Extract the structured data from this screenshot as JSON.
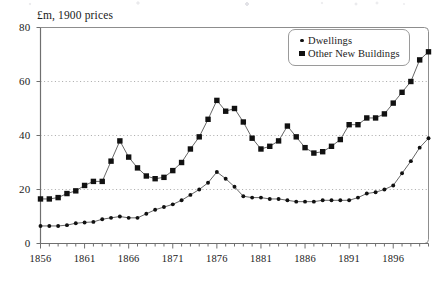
{
  "chart_data": {
    "type": "line",
    "title": "",
    "subtitle": "",
    "axis_note": "£m, 1900 prices",
    "xlabel": "",
    "ylabel": "£m, 1900 prices",
    "xlim": [
      1856,
      1900
    ],
    "ylim": [
      0,
      80
    ],
    "ytick_values": [
      0,
      20,
      40,
      60,
      80
    ],
    "ytick_labels": [
      "0",
      "20",
      "40",
      "60",
      "80"
    ],
    "xtick_values": [
      1856,
      1861,
      1866,
      1871,
      1876,
      1881,
      1886,
      1891,
      1896
    ],
    "xtick_labels": [
      "1856",
      "1861",
      "1866",
      "1871",
      "1876",
      "1881",
      "1886",
      "1891",
      "1896"
    ],
    "x_minor_tick_interval": 1,
    "grid": "horizontal-dotted",
    "legend_position": "top-right",
    "x": [
      1856,
      1857,
      1858,
      1859,
      1860,
      1861,
      1862,
      1863,
      1864,
      1865,
      1866,
      1867,
      1868,
      1869,
      1870,
      1871,
      1872,
      1873,
      1874,
      1875,
      1876,
      1877,
      1878,
      1879,
      1880,
      1881,
      1882,
      1883,
      1884,
      1885,
      1886,
      1887,
      1888,
      1889,
      1890,
      1891,
      1892,
      1893,
      1894,
      1895,
      1896,
      1897,
      1898,
      1899,
      1900
    ],
    "series": [
      {
        "name": "Dwellings",
        "marker": "circle",
        "color": "#111111",
        "values": [
          6.5,
          6.5,
          6.5,
          6.8,
          7.5,
          7.8,
          8.0,
          9.0,
          9.5,
          10.0,
          9.5,
          9.5,
          11.0,
          12.5,
          13.5,
          14.5,
          16.0,
          18.0,
          20.0,
          22.5,
          26.5,
          24.0,
          21.0,
          17.5,
          17.0,
          17.0,
          16.5,
          16.5,
          16.0,
          15.5,
          15.5,
          15.5,
          16.0,
          16.0,
          16.0,
          16.0,
          17.0,
          18.5,
          19.0,
          20.0,
          21.5,
          26.0,
          30.5,
          35.5,
          39.0
        ]
      },
      {
        "name": "Other New Buildings",
        "marker": "square",
        "color": "#111111",
        "values": [
          16.5,
          16.5,
          17.0,
          18.5,
          19.5,
          21.5,
          23.0,
          23.0,
          30.5,
          38.0,
          32.0,
          28.0,
          25.0,
          24.0,
          24.5,
          27.0,
          30.0,
          35.0,
          39.5,
          46.0,
          53.0,
          49.0,
          50.0,
          45.0,
          39.0,
          35.0,
          36.0,
          38.0,
          43.5,
          39.5,
          35.5,
          33.5,
          34.0,
          36.0,
          38.5,
          44.0,
          44.0,
          46.5,
          46.5,
          48.0,
          52.0,
          56.0,
          60.0,
          68.0,
          71.0
        ]
      }
    ]
  },
  "legend": {
    "items": [
      {
        "label": "Dwellings",
        "marker": "circle"
      },
      {
        "label": "Other New Buildings",
        "marker": "square"
      }
    ]
  }
}
